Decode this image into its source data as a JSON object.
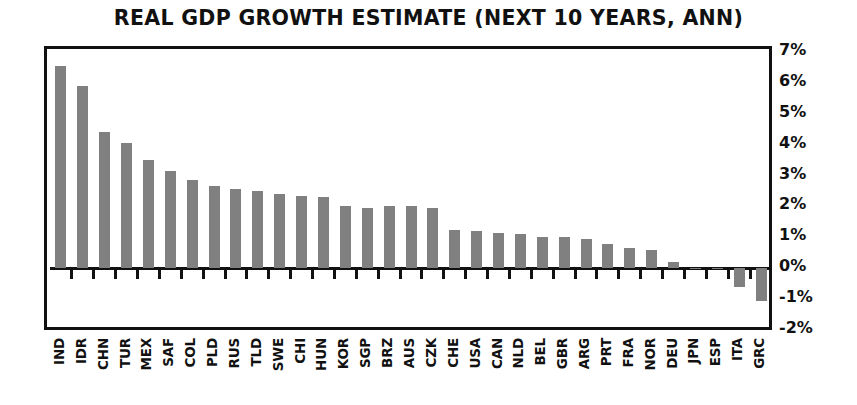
{
  "chart_data": {
    "type": "bar",
    "title": "REAL GDP GROWTH ESTIMATE (NEXT 10 YEARS, ANN)",
    "xlabel": "",
    "ylabel": "",
    "ylim": [
      -2,
      7
    ],
    "ytick_labels": [
      "7%",
      "6%",
      "5%",
      "4%",
      "3%",
      "2%",
      "1%",
      "0%",
      "-1%",
      "-2%"
    ],
    "ytick_values": [
      7,
      6,
      5,
      4,
      3,
      2,
      1,
      0,
      -1,
      -2
    ],
    "grid": false,
    "legend": "none",
    "bar_color": "#808080",
    "axis_color": "#111111",
    "categories": [
      "IND",
      "IDR",
      "CHN",
      "TUR",
      "MEX",
      "SAF",
      "COL",
      "PLD",
      "RUS",
      "TLD",
      "SWE",
      "CHI",
      "HUN",
      "KOR",
      "SGP",
      "BRZ",
      "AUS",
      "CZK",
      "CHE",
      "USA",
      "CAN",
      "NLD",
      "BEL",
      "GBR",
      "ARG",
      "PRT",
      "FRA",
      "NOR",
      "DEU",
      "JPN",
      "ESP",
      "ITA",
      "GRC"
    ],
    "values": [
      6.55,
      5.9,
      4.4,
      4.05,
      3.5,
      3.15,
      2.85,
      2.65,
      2.55,
      2.5,
      2.4,
      2.35,
      2.3,
      2.0,
      1.95,
      2.0,
      2.0,
      1.95,
      1.25,
      1.2,
      1.15,
      1.1,
      1.0,
      1.0,
      0.95,
      0.8,
      0.65,
      0.6,
      0.2,
      0.02,
      0.0,
      -0.6,
      -1.05
    ]
  }
}
